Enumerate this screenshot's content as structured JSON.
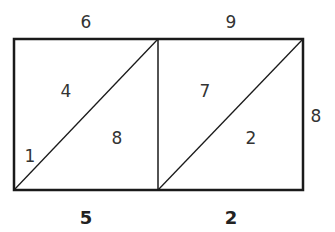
{
  "diagram": {
    "type": "lattice-multiplication",
    "top_digits": [
      "6",
      "9"
    ],
    "side_digit": "8",
    "cells": [
      {
        "column": 0,
        "upper": "4",
        "lower": "8"
      },
      {
        "column": 1,
        "upper": "7",
        "lower": "2"
      }
    ],
    "left_carry": "1",
    "result_digits": [
      "5",
      "2"
    ],
    "colors": {
      "line": "#1a1a1a",
      "text": "#333333"
    }
  }
}
